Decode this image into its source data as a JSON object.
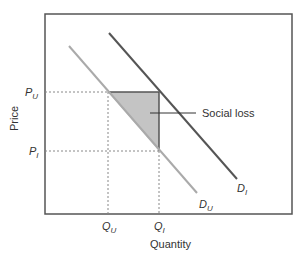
{
  "diagram": {
    "type": "supply-demand",
    "axes": {
      "xlabel": "Quantity",
      "ylabel": "Price"
    },
    "price_labels": {
      "upper": {
        "base": "P",
        "sub": "U"
      },
      "lower": {
        "base": "P",
        "sub": "I"
      }
    },
    "quantity_labels": {
      "left": {
        "base": "Q",
        "sub": "U"
      },
      "right": {
        "base": "Q",
        "sub": "I"
      }
    },
    "curves": [
      {
        "name": "informed-demand",
        "label": {
          "base": "D",
          "sub": "I"
        },
        "color": "#555555"
      },
      {
        "name": "uninformed-demand",
        "label": {
          "base": "D",
          "sub": "U"
        },
        "color": "#aaaaaa"
      }
    ],
    "shaded_area": {
      "label": "Social loss",
      "color": "#c4c4c4"
    }
  }
}
